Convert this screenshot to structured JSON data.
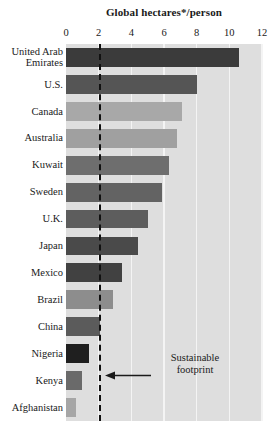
{
  "chart_data": {
    "type": "bar",
    "orientation": "horizontal",
    "title": "Global hectares*/person",
    "xlabel": "",
    "ylabel": "",
    "xlim": [
      0,
      12
    ],
    "xticks": [
      0,
      2,
      4,
      6,
      8,
      10,
      12
    ],
    "xtick_labels": [
      "0",
      "2",
      "4",
      "6",
      "8",
      "10",
      "12"
    ],
    "grid": true,
    "grid_axis": "x",
    "legend": false,
    "categories": [
      "United Arab Emirates",
      "U.S.",
      "Canada",
      "Australia",
      "Kuwait",
      "Sweden",
      "U.K.",
      "Japan",
      "Mexico",
      "Brazil",
      "China",
      "Nigeria",
      "Kenya",
      "Afghanistan"
    ],
    "category_labels": [
      "United Arab\nEmirates",
      "U.S.",
      "Canada",
      "Australia",
      "Kuwait",
      "Sweden",
      "U.K.",
      "Japan",
      "Mexico",
      "Brazil",
      "China",
      "Nigeria",
      "Kenya",
      "Afghanistan"
    ],
    "values": [
      10.6,
      8.0,
      7.1,
      6.8,
      6.3,
      5.9,
      5.0,
      4.4,
      3.4,
      2.9,
      2.1,
      1.4,
      1.0,
      0.6
    ],
    "bar_colors": [
      "#3b3b3b",
      "#555555",
      "#a8a8a8",
      "#a0a0a0",
      "#6e6e6e",
      "#636363",
      "#5d5d5d",
      "#4a4a4a",
      "#414141",
      "#8d8d8d",
      "#5b5b5b",
      "#1f1f1f",
      "#6a6a6a",
      "#a6a6a6"
    ],
    "plot_background": "#dedede",
    "gridline_color": "#f4f4f4",
    "annotations": [
      {
        "name": "sustainable-footprint",
        "text": "Sustainable\nfootprint",
        "value": 2,
        "line_style": "dashed",
        "line_color": "#111111"
      }
    ]
  },
  "colors": {
    "background": "#ffffff",
    "text": "#1a1a1a",
    "plot_background": "#dedede",
    "gridline": "#f4f4f4",
    "threshold": "#111111"
  }
}
